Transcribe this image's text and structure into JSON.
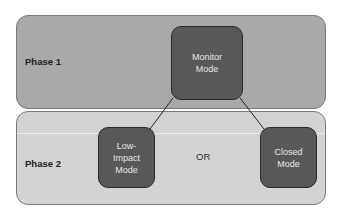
{
  "phases": [
    {
      "label": "Phase 1"
    },
    {
      "label": "Phase 2"
    }
  ],
  "nodes": {
    "monitor": {
      "line1": "Monitor",
      "line2": "Mode"
    },
    "low_impact": {
      "line1": "Low-",
      "line2": "Impact",
      "line3": "Mode"
    },
    "closed": {
      "line1": "Closed",
      "line2": "Mode"
    }
  },
  "connector_label": "OR",
  "colors": {
    "phase1_bg": "#a9a9a9",
    "phase2_bg": "#d3d3d3",
    "node_bg": "#585858",
    "node_text": "#e6e6e6"
  }
}
